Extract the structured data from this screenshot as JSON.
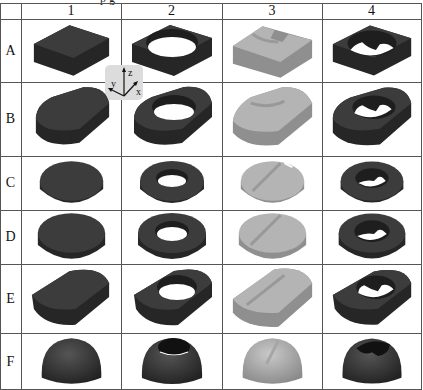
{
  "columns": [
    "1",
    "2",
    "3",
    "4"
  ],
  "rows": [
    "A",
    "B",
    "C",
    "D",
    "E",
    "F"
  ],
  "axis_gizmo": {
    "z": "z",
    "y": "y",
    "x": "x"
  },
  "top_partial_text": "p g",
  "colors": {
    "dark_shape": "#3a3a3a",
    "light_shape": "#a8a8a8",
    "grid": "#555555",
    "gizmo_bg": "#dcdcdc"
  },
  "cells": {
    "A": [
      "square block",
      "square block with round hole",
      "square block with channel",
      "square block with hole and channel"
    ],
    "B": [
      "rounded block",
      "rounded block with round hole",
      "rounded block with channel",
      "rounded block with hole and channel"
    ],
    "C": [
      "disc",
      "disc with round hole",
      "disc with channel",
      "disc with hole and channel"
    ],
    "D": [
      "thicker disc",
      "disc with round hole",
      "disc with channel",
      "disc with hole and channel"
    ],
    "E": [
      "rounded block",
      "rounded block with round hole",
      "rounded block with channel",
      "rounded block with hole and channel"
    ],
    "F": [
      "dome",
      "dome with hole",
      "dome with channel",
      "dome with hole and channel"
    ]
  }
}
